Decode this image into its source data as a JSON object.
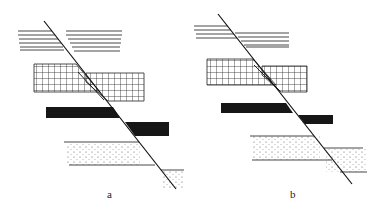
{
  "figure": {
    "panels": [
      {
        "id": "a",
        "label": "a",
        "layers": [
          "horizontal-lined",
          "grid",
          "solid-black",
          "dotted-sandstone"
        ]
      },
      {
        "id": "b",
        "label": "b",
        "layers": [
          "horizontal-lined",
          "grid",
          "solid-black",
          "dotted-sandstone"
        ]
      }
    ]
  },
  "colors": {
    "ink": "#1a1a1a",
    "background": "#ffffff"
  }
}
